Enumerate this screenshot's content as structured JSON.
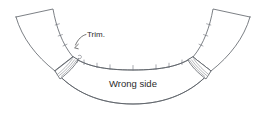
{
  "diagram": {
    "type": "sewing-construction-illustration",
    "background_color": "#ffffff",
    "line_color": "#5b5f66",
    "text_color": "#2b2b2b",
    "labels": {
      "wrong_side": "Wrong side",
      "trim": "Trim."
    },
    "annotations": [
      {
        "name": "trim-callout",
        "text": "Trim.",
        "leader": "curved leader line with arrowhead pointing down-left to the seam allowance corner"
      },
      {
        "name": "wrong-side-label",
        "text": "Wrong side",
        "placement": "centered inside the lower curved band"
      }
    ],
    "notch_marks": {
      "inner_curve_count": 7,
      "left_arm_count": 3,
      "right_arm_count": 3,
      "description": "small clip marks perpendicular to the inner seam line"
    },
    "seam_allowance_panels": [
      {
        "name": "left-seam-allowance",
        "hatch_lines": 3
      },
      {
        "name": "right-seam-allowance",
        "hatch_lines": 3
      }
    ]
  }
}
